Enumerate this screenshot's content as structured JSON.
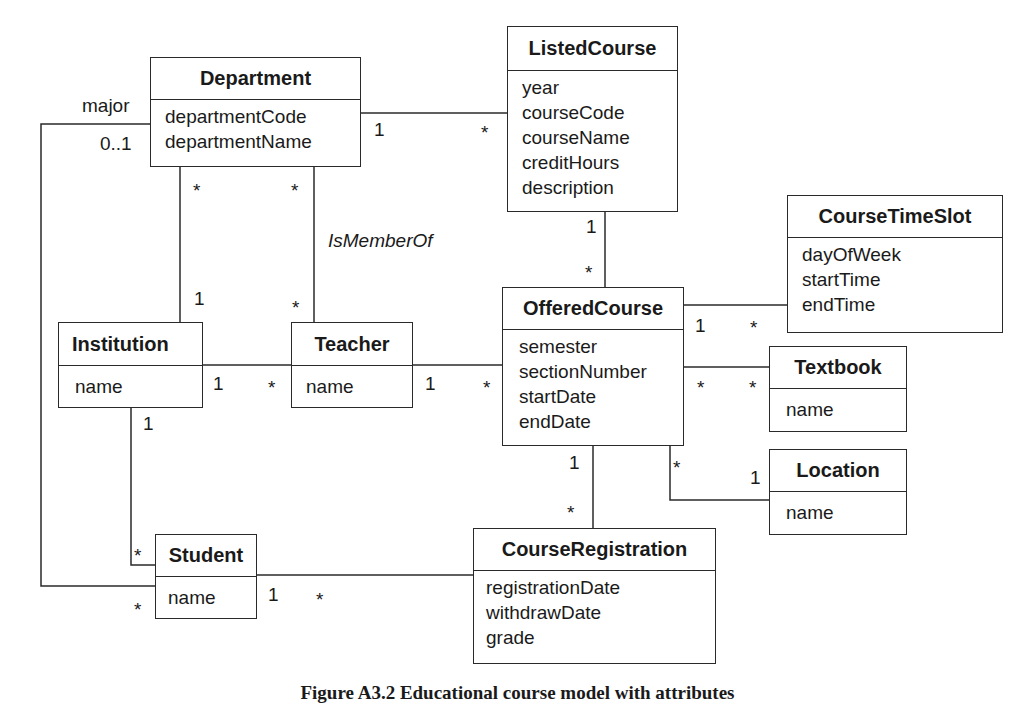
{
  "classes": {
    "department": {
      "name": "Department",
      "attributes": [
        "departmentCode",
        "departmentName"
      ]
    },
    "listed_course": {
      "name": "ListedCourse",
      "attributes": [
        "year",
        "courseCode",
        "courseName",
        "creditHours",
        "description"
      ]
    },
    "course_time_slot": {
      "name": "CourseTimeSlot",
      "attributes": [
        "dayOfWeek",
        "startTime",
        "endTime"
      ]
    },
    "offered_course": {
      "name": "OfferedCourse",
      "attributes": [
        "semester",
        "sectionNumber",
        "startDate",
        "endDate"
      ]
    },
    "institution": {
      "name": "Institution",
      "attributes": [
        "name"
      ]
    },
    "teacher": {
      "name": "Teacher",
      "attributes": [
        "name"
      ]
    },
    "textbook": {
      "name": "Textbook",
      "attributes": [
        "name"
      ]
    },
    "location": {
      "name": "Location",
      "attributes": [
        "name"
      ]
    },
    "student": {
      "name": "Student",
      "attributes": [
        "name"
      ]
    },
    "course_registration": {
      "name": "CourseRegistration",
      "attributes": [
        "registrationDate",
        "withdrawDate",
        "grade"
      ]
    }
  },
  "associations": [
    {
      "from": "Department",
      "to": "ListedCourse",
      "from_mult": "1",
      "to_mult": "*"
    },
    {
      "from": "Department",
      "to": "Institution",
      "from_mult": "*",
      "to_mult": "1"
    },
    {
      "from": "Department",
      "to": "Teacher",
      "from_mult": "*",
      "to_mult": "*",
      "label": "IsMemberOf"
    },
    {
      "from": "Department",
      "to": "Student",
      "from_mult": "0..1",
      "from_role": "major",
      "to_mult": "*"
    },
    {
      "from": "ListedCourse",
      "to": "OfferedCourse",
      "from_mult": "1",
      "to_mult": "*"
    },
    {
      "from": "OfferedCourse",
      "to": "CourseTimeSlot",
      "from_mult": "1",
      "to_mult": "*"
    },
    {
      "from": "Institution",
      "to": "Teacher",
      "from_mult": "1",
      "to_mult": "*"
    },
    {
      "from": "Teacher",
      "to": "OfferedCourse",
      "from_mult": "1",
      "to_mult": "*"
    },
    {
      "from": "OfferedCourse",
      "to": "Textbook",
      "from_mult": "*",
      "to_mult": "*"
    },
    {
      "from": "OfferedCourse",
      "to": "Location",
      "from_mult": "*",
      "to_mult": "1"
    },
    {
      "from": "OfferedCourse",
      "to": "CourseRegistration",
      "from_mult": "1",
      "to_mult": "*"
    },
    {
      "from": "Institution",
      "to": "Student",
      "from_mult": "1",
      "to_mult": "*"
    },
    {
      "from": "Student",
      "to": "CourseRegistration",
      "from_mult": "1",
      "to_mult": "*"
    }
  ],
  "labels": {
    "major": "major",
    "zero_one": "0..1",
    "is_member_of": "IsMemberOf",
    "one": "1",
    "many": "*"
  },
  "caption": "Figure A3.2 Educational course model with attributes"
}
